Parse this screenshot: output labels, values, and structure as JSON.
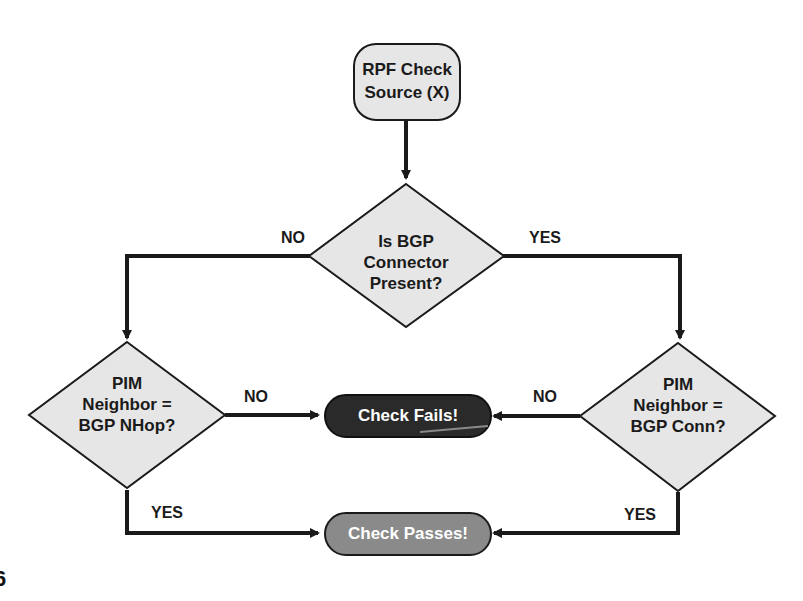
{
  "diagram": {
    "type": "flowchart",
    "colors": {
      "line": "#1a1a1a",
      "node_fill": "#e6e6e6",
      "fail_fill": "#2a2a2a",
      "pass_fill": "#8a8a8a",
      "text_dark": "#1a1a1a",
      "text_light": "#ffffff"
    },
    "nodes": {
      "start": {
        "line1": "RPF Check",
        "line2": "Source (X)"
      },
      "decision_bgp": {
        "line1": "Is BGP",
        "line2": "Connector",
        "line3": "Present?"
      },
      "decision_nhop": {
        "line1": "PIM",
        "line2": "Neighbor =",
        "line3": "BGP NHop?"
      },
      "decision_conn": {
        "line1": "PIM",
        "line2": "Neighbor =",
        "line3": "BGP Conn?"
      },
      "fail": {
        "label": "Check Fails!"
      },
      "pass": {
        "label": "Check Passes!"
      }
    },
    "edges": {
      "bgp_no": "NO",
      "bgp_yes": "YES",
      "nhop_no": "NO",
      "nhop_yes": "YES",
      "conn_no": "NO",
      "conn_yes": "YES"
    },
    "corner_fragment": "6"
  }
}
